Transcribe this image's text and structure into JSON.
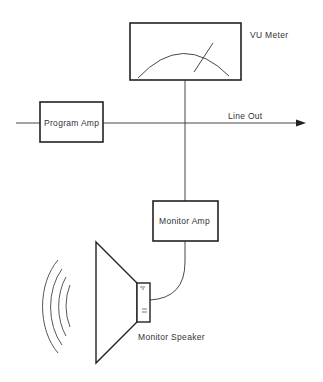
{
  "diagram": {
    "vu_meter": {
      "label": "VU Meter"
    },
    "program_amp": {
      "label": "Program Amp"
    },
    "line_out": {
      "label": "Line Out"
    },
    "monitor_amp": {
      "label": "Monitor Amp"
    },
    "monitor_speaker": {
      "label": "Monitor Speaker"
    }
  }
}
